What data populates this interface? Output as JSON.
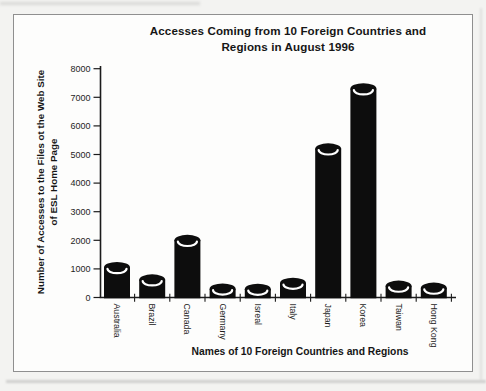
{
  "title": {
    "line1": "Accesses Coming from 10 Foreign Countries and",
    "line2": "Regions in August 1996"
  },
  "axes": {
    "ylabel_line1": "Number of Accesses to the Files ot the Web Site",
    "ylabel_line2": "of ESL Home Page",
    "xlabel": "Names of 10 Foreign Countries and Regions"
  },
  "chart_data": {
    "type": "bar",
    "style": "3d-cylinder solid black bars, scanned grayscale figure",
    "title": "Accesses Coming from 10 Foreign Countries and Regions in August 1996",
    "xlabel": "Names of 10 Foreign Countries and Regions",
    "ylabel": "Number of Accesses to the Files ot the Web Site of ESL Home Page",
    "categories": [
      "Australia",
      "Brazil",
      "Canada",
      "Germany",
      "Isreal",
      "Italy",
      "Japan",
      "Korea",
      "Taiwan",
      "Hong Kong"
    ],
    "values": [
      1050,
      620,
      2000,
      300,
      290,
      500,
      5200,
      7300,
      400,
      330
    ],
    "ylim": [
      0,
      8000
    ],
    "yticks": [
      0,
      1000,
      2000,
      3000,
      4000,
      5000,
      6000,
      7000,
      8000
    ],
    "grid": false,
    "legend": false,
    "bar_color": "#0d0d0d",
    "highlight_color": "#ffffff",
    "axis_color": "#1c1c1c",
    "frame_border_color": "#8f8f8f",
    "paper_color": "#fdfdfc"
  }
}
